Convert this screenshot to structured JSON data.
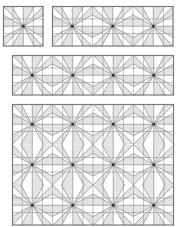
{
  "figure": {
    "colors": {
      "background": "#ffffff",
      "stroke": "#8a8a8a",
      "grid": "#9a9a9a",
      "shade": "#e4e4e4",
      "hub": "#333333",
      "border": "#7a7a7a"
    },
    "unit_size_px": 40.5,
    "panels": [
      {
        "id": "panel-1",
        "x": 3,
        "y": 6,
        "cols": 1,
        "rows": 1
      },
      {
        "id": "panel-2",
        "x": 52,
        "y": 6,
        "cols": 3,
        "rows": 1
      },
      {
        "id": "panel-3",
        "x": 12,
        "y": 55,
        "cols": 4,
        "rows": 1
      },
      {
        "id": "panel-4",
        "x": 12,
        "y": 104,
        "cols": 4,
        "rows": 3
      }
    ]
  }
}
